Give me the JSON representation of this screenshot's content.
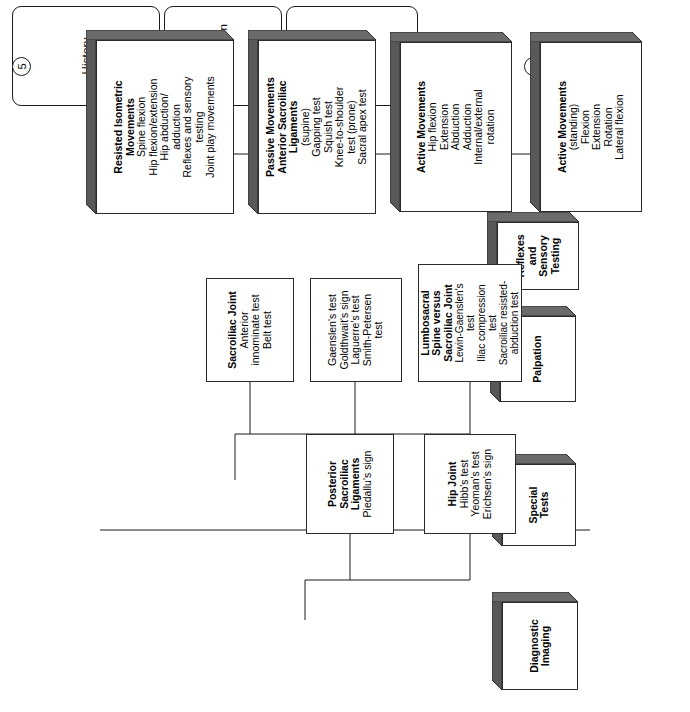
{
  "diagram": {
    "orientation": "rotated-90",
    "phases": [
      {
        "id": "history",
        "label": "History"
      },
      {
        "id": "observation",
        "label": "Observation"
      },
      {
        "id": "physical-examination",
        "label": "Physical Examination"
      }
    ],
    "step_numbers": [
      "1",
      "2",
      "3",
      "4",
      "5"
    ],
    "columns": {
      "col1": [
        {
          "id": "active-movements-standing",
          "style": "box3d",
          "title": [
            "Active Movements"
          ],
          "items": [
            "(standing)",
            "Flexion",
            "Extension",
            "Rotation",
            "Lateral flexion"
          ]
        },
        {
          "id": "active-movements-hip",
          "style": "box3d",
          "title": [
            "Active Movements"
          ],
          "items": [
            "Hip flexion",
            "Extension",
            "Abduction",
            "Adduction",
            "Internal/external",
            "rotation"
          ]
        },
        {
          "id": "passive-movements-anterior-sacroiliac-ligaments",
          "style": "box3d",
          "title": [
            "Passive Movements",
            "Anterior Sacroiliac",
            "Ligaments"
          ],
          "items": [
            "(supine)",
            "Gapping test",
            "Squish test",
            "Knee-to-shoulder",
            "test (prone)",
            "Sacral apex test"
          ]
        },
        {
          "id": "resisted-isometric-movements",
          "style": "box3d",
          "title": [
            "Resisted Isometric",
            "Movements"
          ],
          "items": [
            "Spine flexion",
            "Hip flexion/extension",
            "Hip abduction/",
            "adduction",
            "Reflexes and sensory",
            "testing",
            "Joint play movements"
          ]
        }
      ],
      "col2": [
        {
          "id": "reflexes-and-sensory-testing",
          "style": "box3d",
          "title": [
            "Reflexes",
            "and",
            "Sensory",
            "Testing"
          ],
          "items": []
        }
      ],
      "col3": [
        {
          "id": "palpation",
          "style": "box3d",
          "title": [
            "Palpation"
          ],
          "items": []
        }
      ],
      "col4": [
        {
          "id": "special-tests",
          "style": "box3d",
          "title": [
            "Special",
            "Tests"
          ],
          "items": []
        },
        {
          "id": "sacroiliac-joint",
          "style": "boxflat",
          "title": [
            "Sacroiliac Joint"
          ],
          "items": [
            "Anterior",
            "innominate test",
            "Belt test"
          ]
        },
        {
          "id": "sacroiliac-joint-tests-2",
          "style": "boxflat",
          "title": [],
          "items": [
            "Gaenslen's test",
            "Goldthwait's sign",
            "Laguerre's test",
            "Smith-Petersen",
            "test"
          ]
        },
        {
          "id": "lumbosacral-spine-versus-sacroiliac-joint",
          "style": "boxflat",
          "title": [
            "Lumbosacral",
            "Spine versus",
            "Sacroiliac Joint"
          ],
          "items": [
            "Lewin-Gaenslen's",
            "test",
            "Iliac compression",
            "test",
            "Sacroiliac resisted-",
            "abduction test"
          ]
        }
      ],
      "col5": [
        {
          "id": "diagnostic-imaging",
          "style": "box3d",
          "title": [
            "Diagnostic",
            "Imaging"
          ],
          "items": []
        },
        {
          "id": "posterior-sacroiliac-ligaments",
          "style": "boxflat",
          "title": [
            "Posterior",
            "Sacroiliac",
            "Ligaments"
          ],
          "items": [
            "Piedallu's sign"
          ]
        },
        {
          "id": "hip-joint",
          "style": "boxflat",
          "title": [
            "Hip Joint"
          ],
          "items": [
            "Hibb's test",
            "Yeoman's test",
            "Erichsen's sign"
          ]
        }
      ]
    },
    "colors": {
      "line": "#1a1a1a",
      "box_fill": "#ffffff",
      "box_shadow_top": "#585858",
      "box_shadow_side": "#6b6b6b"
    }
  }
}
